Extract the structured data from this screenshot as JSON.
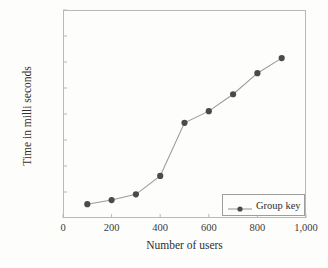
{
  "chart_data": {
    "type": "line",
    "title": "",
    "xlabel": "Number of users",
    "ylabel": "Time in milli seconds",
    "xlim": [
      0,
      1000
    ],
    "ylim": [
      0.0,
      0.4
    ],
    "grid": false,
    "legend_position": "bottom-right",
    "x": [
      100,
      200,
      300,
      400,
      500,
      600,
      700,
      800,
      900
    ],
    "series": [
      {
        "name": "Group key",
        "values": [
          0.0265,
          0.0345,
          0.0455,
          0.081,
          0.183,
          0.2055,
          0.238,
          0.2785,
          0.3075
        ]
      }
    ],
    "x_tick_labels": [
      "0",
      "200",
      "400",
      "600",
      "800",
      "1,000"
    ],
    "x_tick_values": [
      0,
      200,
      400,
      600,
      800,
      1000
    ],
    "y_tick_labels": [
      "0.4",
      "0.35",
      "0.3",
      "0.25",
      "0.2",
      "0.15",
      "0.1",
      "5· 10"
    ],
    "y_tick_exponent": "−2",
    "y_tick_values": [
      0.4,
      0.35,
      0.3,
      0.25,
      0.2,
      0.15,
      0.1,
      0.05
    ],
    "colors": {
      "marker": "#4a4a4a",
      "line": "#9b9b9b",
      "axis": "#b9b9b9",
      "text": "#2e2e2e",
      "background": "#fdfdfb"
    }
  },
  "legend": {
    "label": "Group key"
  }
}
